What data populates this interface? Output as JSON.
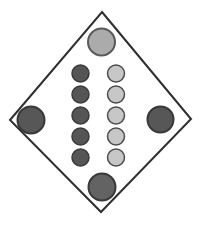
{
  "figure": {
    "background": "#ffffff",
    "diamond": {
      "points": "102,12 191,119 101,212 10,120",
      "fill": "#ffffff",
      "stroke": "#2e2e2e",
      "stroke_width": 2
    },
    "colors": {
      "dark_fill": "#575757",
      "dark_stroke": "#383838",
      "light_fill": "#c7c7c7",
      "light_stroke": "#4c4c4c",
      "medium_fill": "#ababab",
      "medium_stroke": "#5a5a5a"
    },
    "circles": [
      {
        "name": "top-vertex-dot",
        "cx": 101.5,
        "cy": 42,
        "r": 13.5,
        "fill": "#ababab",
        "stroke": "#5a5a5a",
        "stroke_width": 2
      },
      {
        "name": "left-vertex-dot",
        "cx": 31,
        "cy": 120,
        "r": 13.5,
        "fill": "#575757",
        "stroke": "#383838",
        "stroke_width": 2
      },
      {
        "name": "right-vertex-dot",
        "cx": 160.5,
        "cy": 119.5,
        "r": 13,
        "fill": "#575757",
        "stroke": "#383838",
        "stroke_width": 2
      },
      {
        "name": "bottom-vertex-dot",
        "cx": 102,
        "cy": 187,
        "r": 13.5,
        "fill": "#636363",
        "stroke": "#383838",
        "stroke_width": 2
      },
      {
        "name": "dark-column-dot-1",
        "cx": 80.5,
        "cy": 73.5,
        "r": 8.5,
        "fill": "#555555",
        "stroke": "#3a3a3a",
        "stroke_width": 1.5
      },
      {
        "name": "dark-column-dot-2",
        "cx": 80.5,
        "cy": 94.5,
        "r": 8.5,
        "fill": "#555555",
        "stroke": "#3a3a3a",
        "stroke_width": 1.5
      },
      {
        "name": "dark-column-dot-3",
        "cx": 80.5,
        "cy": 115.5,
        "r": 8.5,
        "fill": "#555555",
        "stroke": "#3a3a3a",
        "stroke_width": 1.5
      },
      {
        "name": "dark-column-dot-4",
        "cx": 80.5,
        "cy": 136.5,
        "r": 8.5,
        "fill": "#555555",
        "stroke": "#3a3a3a",
        "stroke_width": 1.5
      },
      {
        "name": "dark-column-dot-5",
        "cx": 80.5,
        "cy": 157.5,
        "r": 8.5,
        "fill": "#555555",
        "stroke": "#3a3a3a",
        "stroke_width": 1.5
      },
      {
        "name": "light-column-dot-1",
        "cx": 116,
        "cy": 73.5,
        "r": 8.5,
        "fill": "#c7c7c7",
        "stroke": "#4c4c4c",
        "stroke_width": 1.5
      },
      {
        "name": "light-column-dot-2",
        "cx": 116,
        "cy": 94.5,
        "r": 8.5,
        "fill": "#c7c7c7",
        "stroke": "#4c4c4c",
        "stroke_width": 1.5
      },
      {
        "name": "light-column-dot-3",
        "cx": 116,
        "cy": 115.5,
        "r": 8.5,
        "fill": "#c7c7c7",
        "stroke": "#4c4c4c",
        "stroke_width": 1.5
      },
      {
        "name": "light-column-dot-4",
        "cx": 116,
        "cy": 136.5,
        "r": 8.5,
        "fill": "#c7c7c7",
        "stroke": "#4c4c4c",
        "stroke_width": 1.5
      },
      {
        "name": "light-column-dot-5",
        "cx": 116,
        "cy": 157.5,
        "r": 8.5,
        "fill": "#c7c7c7",
        "stroke": "#4c4c4c",
        "stroke_width": 1.5
      }
    ]
  }
}
